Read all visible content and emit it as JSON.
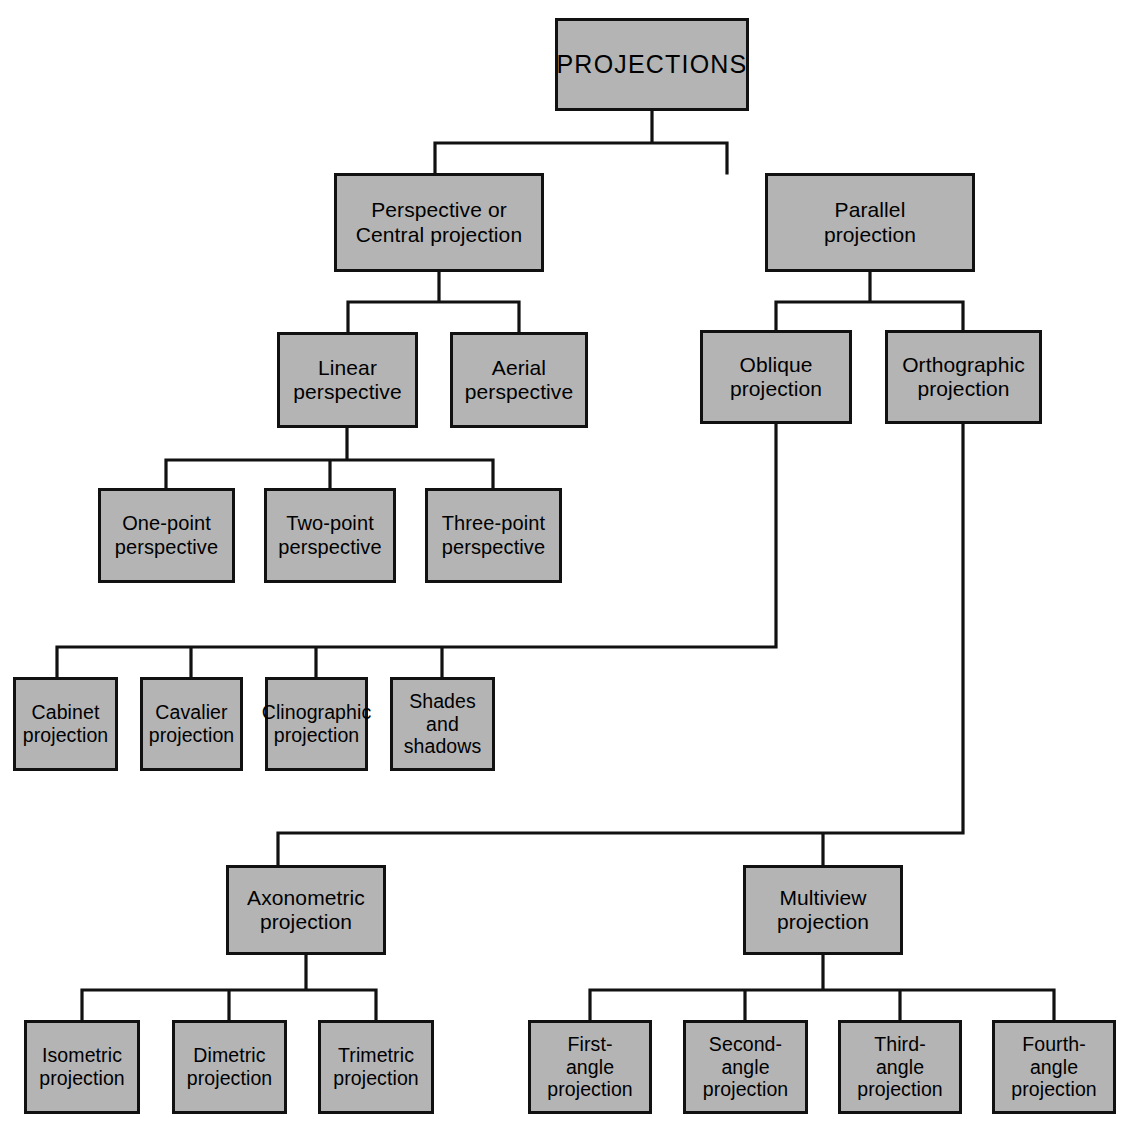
{
  "diagram": {
    "title": "PROJECTIONS",
    "type": "hierarchy-tree",
    "style": {
      "box_fill": "#b4b4b4",
      "box_border": "#111111",
      "line_color": "#111111",
      "background": "#ffffff",
      "text_color": "#000000"
    },
    "nodes": [
      {
        "id": "projections",
        "label": "PROJECTIONS",
        "level": 0,
        "x": 555,
        "y": 18,
        "w": 194,
        "h": 93,
        "cls": "root"
      },
      {
        "id": "perspective",
        "label": "Perspective or\nCentral projection",
        "level": 1,
        "x": 334,
        "y": 173,
        "w": 210,
        "h": 99,
        "cls": "lvl2"
      },
      {
        "id": "parallel",
        "label": "Parallel\nprojection",
        "level": 1,
        "x": 765,
        "y": 173,
        "w": 210,
        "h": 99,
        "cls": "lvl2"
      },
      {
        "id": "linear",
        "label": "Linear\nperspective",
        "level": 2,
        "x": 277,
        "y": 332,
        "w": 141,
        "h": 96,
        "cls": "lvl3"
      },
      {
        "id": "aerial",
        "label": "Aerial\nperspective",
        "level": 2,
        "x": 450,
        "y": 332,
        "w": 138,
        "h": 96,
        "cls": "lvl3"
      },
      {
        "id": "oblique",
        "label": "Oblique\nprojection",
        "level": 2,
        "x": 700,
        "y": 330,
        "w": 152,
        "h": 94,
        "cls": "lvl3"
      },
      {
        "id": "orthographic",
        "label": "Orthographic\nprojection",
        "level": 2,
        "x": 885,
        "y": 330,
        "w": 157,
        "h": 94,
        "cls": "lvl3"
      },
      {
        "id": "one-point",
        "label": "One-point\nperspective",
        "level": 3,
        "x": 98,
        "y": 488,
        "w": 137,
        "h": 95,
        "cls": "leaf"
      },
      {
        "id": "two-point",
        "label": "Two-point\nperspective",
        "level": 3,
        "x": 264,
        "y": 488,
        "w": 132,
        "h": 95,
        "cls": "leaf"
      },
      {
        "id": "three-point",
        "label": "Three-point\nperspective",
        "level": 3,
        "x": 425,
        "y": 488,
        "w": 137,
        "h": 95,
        "cls": "leaf"
      },
      {
        "id": "cabinet",
        "label": "Cabinet\nprojection",
        "level": 3,
        "x": 13,
        "y": 677,
        "w": 105,
        "h": 94,
        "cls": "small"
      },
      {
        "id": "cavalier",
        "label": "Cavalier\nprojection",
        "level": 3,
        "x": 140,
        "y": 677,
        "w": 103,
        "h": 94,
        "cls": "small"
      },
      {
        "id": "clinographic",
        "label": "Clinographic\nprojection",
        "level": 3,
        "x": 265,
        "y": 677,
        "w": 103,
        "h": 94,
        "cls": "small"
      },
      {
        "id": "shades",
        "label": "Shades and\nshadows",
        "level": 3,
        "x": 390,
        "y": 677,
        "w": 105,
        "h": 94,
        "cls": "small"
      },
      {
        "id": "axonometric",
        "label": "Axonometric\nprojection",
        "level": 3,
        "x": 226,
        "y": 865,
        "w": 160,
        "h": 90,
        "cls": "lvl4"
      },
      {
        "id": "multiview",
        "label": "Multiview\nprojection",
        "level": 3,
        "x": 743,
        "y": 865,
        "w": 160,
        "h": 90,
        "cls": "lvl4"
      },
      {
        "id": "isometric",
        "label": "Isometric\nprojection",
        "level": 4,
        "x": 24,
        "y": 1020,
        "w": 116,
        "h": 94,
        "cls": "small"
      },
      {
        "id": "dimetric",
        "label": "Dimetric\nprojection",
        "level": 4,
        "x": 172,
        "y": 1020,
        "w": 115,
        "h": 94,
        "cls": "small"
      },
      {
        "id": "trimetric",
        "label": "Trimetric\nprojection",
        "level": 4,
        "x": 318,
        "y": 1020,
        "w": 116,
        "h": 94,
        "cls": "small"
      },
      {
        "id": "first-angle",
        "label": "First-\nangle\nprojection",
        "level": 4,
        "x": 528,
        "y": 1020,
        "w": 124,
        "h": 94,
        "cls": "small"
      },
      {
        "id": "second-angle",
        "label": "Second-\nangle\nprojection",
        "level": 4,
        "x": 683,
        "y": 1020,
        "w": 125,
        "h": 94,
        "cls": "small"
      },
      {
        "id": "third-angle",
        "label": "Third-\nangle\nprojection",
        "level": 4,
        "x": 838,
        "y": 1020,
        "w": 124,
        "h": 94,
        "cls": "small"
      },
      {
        "id": "fourth-angle",
        "label": "Fourth-\nangle\nprojection",
        "level": 4,
        "x": 992,
        "y": 1020,
        "w": 124,
        "h": 94,
        "cls": "small"
      }
    ],
    "edges": [
      {
        "from": "projections",
        "to": [
          "perspective",
          "parallel"
        ]
      },
      {
        "from": "perspective",
        "to": [
          "linear",
          "aerial"
        ]
      },
      {
        "from": "parallel",
        "to": [
          "oblique",
          "orthographic"
        ]
      },
      {
        "from": "linear",
        "to": [
          "one-point",
          "two-point",
          "three-point"
        ]
      },
      {
        "from": "oblique",
        "to": [
          "cabinet",
          "cavalier",
          "clinographic",
          "shades"
        ]
      },
      {
        "from": "orthographic",
        "to": [
          "axonometric",
          "multiview"
        ]
      },
      {
        "from": "axonometric",
        "to": [
          "isometric",
          "dimetric",
          "trimetric"
        ]
      },
      {
        "from": "multiview",
        "to": [
          "first-angle",
          "second-angle",
          "third-angle",
          "fourth-angle"
        ]
      }
    ],
    "wire_paths": [
      "M652,111 L652,143 M435,143 L727,143 M435,143 L435,173 M727,143 L727,173",
      "M439,272 L439,302 M348,302 L519,302 M348,302 L348,332 M519,302 L519,332",
      "M870,272 L870,302 M776,302 L963,302 M776,302 L776,330 M963,302 L963,330",
      "M347,428 L347,460 M166,460 L493,460 M166,460 L166,488 M330,460 L330,488 M493,460 L493,488",
      "M776,424 L776,647 M57,647 L776,647 M57,647 L57,677 M191,647 L191,677 M316,647 L316,677 M442,647 L442,677",
      "M963,424 L963,833 M278,833 L963,833 M278,833 L278,865 M823,833 L823,865",
      "M306,955 L306,990 M82,990 L376,990 M82,990 L82,1020 M229,990 L229,1020 M376,990 L376,1020",
      "M823,955 L823,990 M590,990 L1054,990 M590,990 L590,1020 M745,990 L745,1020 M900,990 L900,1020 M1054,990 L1054,1020"
    ]
  }
}
